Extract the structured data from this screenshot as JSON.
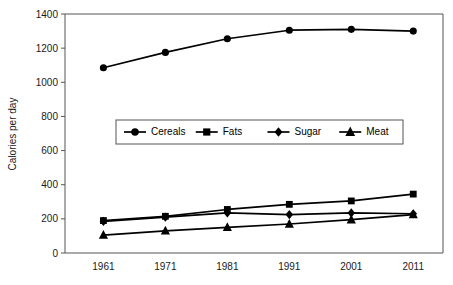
{
  "chart_data": {
    "type": "line",
    "title": "",
    "subtitle": "",
    "xlabel": "",
    "ylabel": "Calories per day",
    "categories": [
      "1961",
      "1971",
      "1981",
      "1991",
      "2001",
      "2011"
    ],
    "x": [
      1961,
      1971,
      1981,
      1991,
      2001,
      2011
    ],
    "series": [
      {
        "name": "Cereals",
        "marker": "circle",
        "values": [
          1085,
          1175,
          1255,
          1305,
          1310,
          1300
        ]
      },
      {
        "name": "Fats",
        "marker": "square",
        "values": [
          190,
          215,
          255,
          285,
          305,
          345
        ]
      },
      {
        "name": "Sugar",
        "marker": "diamond",
        "values": [
          185,
          210,
          235,
          225,
          235,
          230
        ]
      },
      {
        "name": "Meat",
        "marker": "triangle",
        "values": [
          105,
          130,
          150,
          170,
          195,
          225
        ]
      }
    ],
    "ylim": [
      0,
      1400
    ],
    "ytick_values": [
      0,
      200,
      400,
      600,
      800,
      1000,
      1200,
      1400
    ],
    "ytick_labels": [
      "0",
      "200",
      "400",
      "600",
      "800",
      "1000",
      "1200",
      "1400"
    ],
    "xtick_labels": [
      "1961",
      "1971",
      "1981",
      "1991",
      "2001",
      "2011"
    ],
    "grid": false,
    "legend_position": "inside-upper-center",
    "series_color": "#000000",
    "axis_color": "#555555",
    "background": "#ffffff"
  }
}
